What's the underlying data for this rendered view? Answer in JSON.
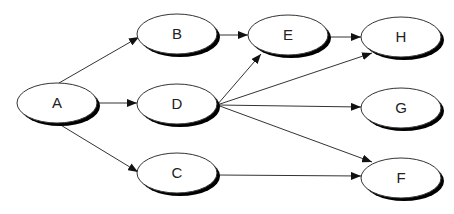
{
  "diagram": {
    "type": "directed-graph",
    "colors": {
      "stroke": "#333333",
      "fill": "#ffffff",
      "shadow": "#000000",
      "text": "#222222"
    },
    "nodes": [
      {
        "id": "A",
        "label": "A",
        "cx": 57,
        "cy": 103,
        "rx": 40,
        "ry": 20
      },
      {
        "id": "B",
        "label": "B",
        "cx": 177,
        "cy": 34,
        "rx": 40,
        "ry": 20
      },
      {
        "id": "D",
        "label": "D",
        "cx": 177,
        "cy": 104,
        "rx": 40,
        "ry": 20
      },
      {
        "id": "C",
        "label": "C",
        "cx": 177,
        "cy": 173,
        "rx": 40,
        "ry": 20
      },
      {
        "id": "E",
        "label": "E",
        "cx": 288,
        "cy": 35,
        "rx": 40,
        "ry": 20
      },
      {
        "id": "H",
        "label": "H",
        "cx": 401,
        "cy": 37,
        "rx": 40,
        "ry": 20
      },
      {
        "id": "G",
        "label": "G",
        "cx": 401,
        "cy": 108,
        "rx": 40,
        "ry": 20
      },
      {
        "id": "F",
        "label": "F",
        "cx": 401,
        "cy": 178,
        "rx": 40,
        "ry": 20
      }
    ],
    "edges": [
      {
        "from": "A",
        "to": "B",
        "x1": 59,
        "y1": 83,
        "x2": 139,
        "y2": 37
      },
      {
        "from": "A",
        "to": "D",
        "x1": 97,
        "y1": 103,
        "x2": 137,
        "y2": 103
      },
      {
        "from": "A",
        "to": "C",
        "x1": 59,
        "y1": 124,
        "x2": 138,
        "y2": 172
      },
      {
        "from": "B",
        "to": "E",
        "x1": 217,
        "y1": 35,
        "x2": 248,
        "y2": 35
      },
      {
        "from": "E",
        "to": "H",
        "x1": 328,
        "y1": 37,
        "x2": 361,
        "y2": 37
      },
      {
        "from": "D",
        "to": "E",
        "x1": 217,
        "y1": 105,
        "x2": 261,
        "y2": 54
      },
      {
        "from": "D",
        "to": "H",
        "x1": 217,
        "y1": 105,
        "x2": 372,
        "y2": 53
      },
      {
        "from": "D",
        "to": "G",
        "x1": 217,
        "y1": 105,
        "x2": 361,
        "y2": 107
      },
      {
        "from": "D",
        "to": "F",
        "x1": 217,
        "y1": 105,
        "x2": 372,
        "y2": 162
      },
      {
        "from": "C",
        "to": "F",
        "x1": 217,
        "y1": 175,
        "x2": 361,
        "y2": 176
      }
    ]
  }
}
